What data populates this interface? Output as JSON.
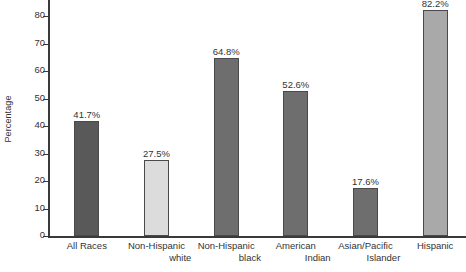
{
  "chart_data": {
    "type": "bar",
    "title": "",
    "subtitle": "",
    "xlabel": "",
    "ylabel": "Percentage",
    "ylim": [
      0,
      85
    ],
    "grid": false,
    "legend": "none",
    "yticks": [
      0,
      10,
      20,
      30,
      40,
      50,
      60,
      70,
      80
    ],
    "ytick_labels": [
      "0",
      "10",
      "20",
      "30",
      "40",
      "50",
      "60",
      "70",
      "80"
    ],
    "categories": [
      "All Races",
      "Non-Hispanic white",
      "Non-Hispanic black",
      "American Indian",
      "Asian/Pacific Islander",
      "Hispanic"
    ],
    "category_lines": [
      [
        "All Races",
        ""
      ],
      [
        "Non-Hispanic",
        "white"
      ],
      [
        "Non-Hispanic",
        "black"
      ],
      [
        "American",
        "Indian"
      ],
      [
        "Asian/Pacific",
        "Islander"
      ],
      [
        "Hispanic",
        ""
      ]
    ],
    "values": [
      41.7,
      27.5,
      64.8,
      52.6,
      17.6,
      82.2
    ],
    "value_labels": [
      "41.7%",
      "27.5%",
      "64.8%",
      "52.6%",
      "17.6%",
      "82.2%"
    ],
    "bar_colors": [
      "#595959",
      "#dcdcdc",
      "#6e6e6e",
      "#6e6e6e",
      "#6e6e6e",
      "#a9a9a9"
    ],
    "bar_edge_color": "#4a4a4a",
    "axis_color": "#3a3a3a",
    "text_color": "#333333",
    "background": "#ffffff",
    "note": "Top value label for Hispanic bar is clipped by the top edge of the screenshot"
  }
}
